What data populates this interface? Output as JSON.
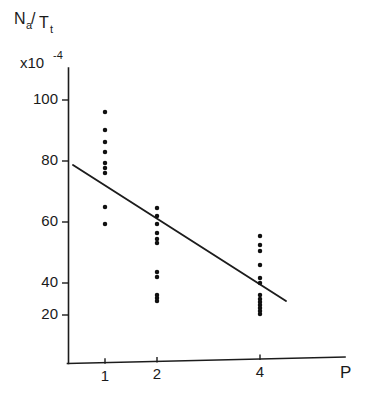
{
  "figure": {
    "kind": "scatter-plot",
    "background_color": "#ffffff",
    "ink_color": "#1a1a1a"
  },
  "labels": {
    "y_axis_numerator": "N",
    "y_axis_numerator_sub": "a",
    "y_axis_slash": "/",
    "y_axis_denominator": "T",
    "y_axis_denominator_sub": "t",
    "y_axis_multiplier_base": "x10",
    "y_axis_multiplier_exponent": "-4",
    "x_axis_title": "P"
  },
  "chart_data": {
    "type": "scatter",
    "title": "",
    "xlabel": "P",
    "ylabel": "Na/Tt",
    "y_multiplier": "x10^-4",
    "grid": false,
    "legend": false,
    "x_tick_labels": [
      "1",
      "2",
      "4"
    ],
    "x_tick_values": [
      1,
      2,
      4
    ],
    "x_tick_pixels": [
      105,
      157,
      260
    ],
    "y_tick_labels": [
      "20",
      "40",
      "60",
      "80",
      "100"
    ],
    "y_tick_values": [
      20,
      40,
      60,
      80,
      100
    ],
    "y_tick_pixels": [
      315,
      283,
      222,
      161,
      100
    ],
    "ylim": [
      0,
      110
    ],
    "xlim_pixels": [
      68,
      345
    ],
    "axis_origin_pixel": [
      68,
      363
    ],
    "series": [
      {
        "name": "P = 1",
        "x": 1,
        "x_pixel": 105,
        "values": [
          93,
          85,
          80,
          77,
          73,
          71,
          70,
          60,
          54
        ],
        "y_pixels": [
          112,
          130,
          142,
          152,
          163,
          168,
          173,
          207,
          224
        ]
      },
      {
        "name": "P = 2",
        "x": 2,
        "x_pixel": 157,
        "values": [
          64,
          61,
          58,
          55,
          53,
          52,
          43,
          41,
          35,
          34,
          33
        ],
        "y_pixels": [
          208,
          216,
          224,
          233,
          239,
          243,
          272,
          277,
          295,
          298,
          301
        ]
      },
      {
        "name": "P = 4",
        "x": 4,
        "x_pixel": 260,
        "values": [
          55,
          52,
          50,
          45,
          41,
          39,
          35,
          33,
          32,
          31,
          30,
          29,
          28
        ],
        "y_pixels": [
          236,
          245,
          251,
          265,
          278,
          283,
          295,
          299,
          302,
          305,
          308,
          311,
          314
        ]
      }
    ],
    "trend_line": {
      "name": "regression-line",
      "x_start_pixel": 73,
      "y_start_pixel": 165,
      "x_end_pixel": 286,
      "y_end_pixel": 301,
      "value_at_start": 73,
      "value_at_end": 30
    }
  }
}
